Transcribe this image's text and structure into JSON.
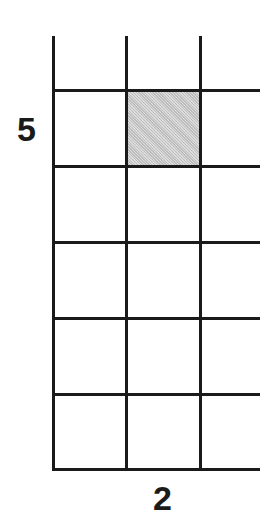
{
  "diagram": {
    "type": "grid",
    "columns": 3,
    "rows": 5,
    "row_label": "5",
    "column_label": "2",
    "shaded_cell": {
      "row": 1,
      "column": 2
    },
    "colors": {
      "line": "#1a1a1a",
      "shade": "#c9c9c9",
      "background": "#ffffff"
    }
  }
}
